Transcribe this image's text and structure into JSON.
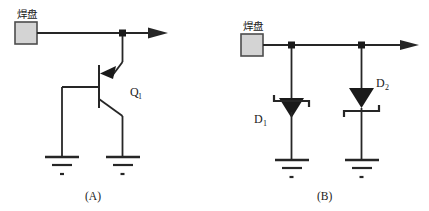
{
  "figure": {
    "background": "#ffffff",
    "ink": "#262626",
    "pad_fill": "#d4d4d4",
    "pad_stroke": "#4d4d4d"
  },
  "panels": [
    {
      "id": "panel-a",
      "caption": "(A)",
      "pad_label": "焊盘",
      "components": [
        {
          "id": "q1",
          "label": "Q",
          "subscript": "1",
          "type": "pnp-transistor"
        }
      ],
      "grounds": 2,
      "junctions": 1
    },
    {
      "id": "panel-b",
      "caption": "(B)",
      "pad_label": "焊盘",
      "components": [
        {
          "id": "d1",
          "label": "D",
          "subscript": "1",
          "type": "zener-diode"
        },
        {
          "id": "d2",
          "label": "D",
          "subscript": "2",
          "type": "zener-diode"
        }
      ],
      "grounds": 2,
      "junctions": 2
    }
  ]
}
